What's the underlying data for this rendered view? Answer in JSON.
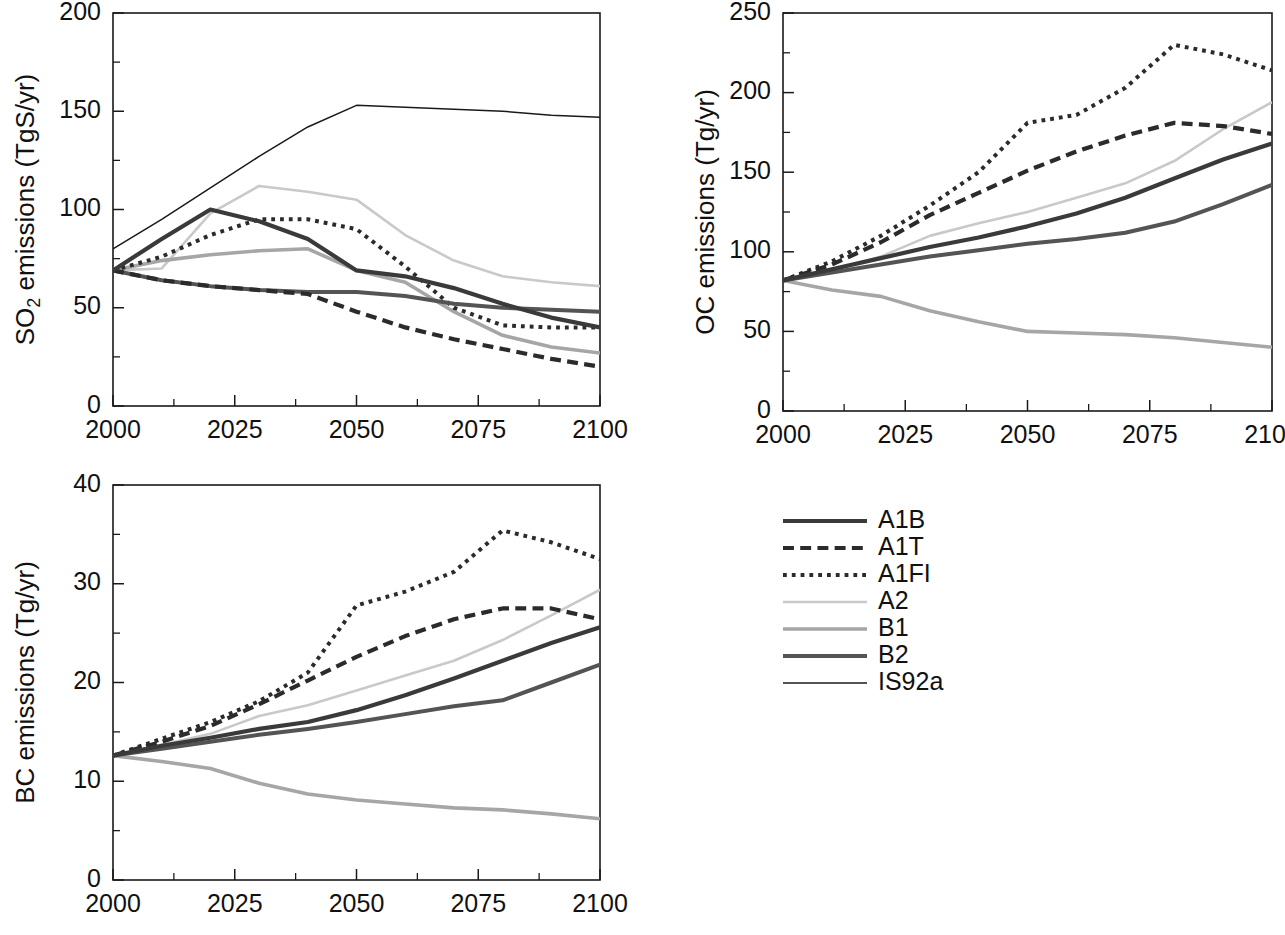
{
  "figure": {
    "panels": [
      "so2",
      "oc",
      "bc"
    ],
    "x_tick_labels": [
      "2000",
      "2025",
      "2050",
      "2075",
      "2100"
    ],
    "x_ticks": [
      2000,
      2025,
      2050,
      2075,
      2100
    ],
    "xlim": [
      2000,
      2100
    ],
    "x_minor_step": 12.5
  },
  "legend": {
    "position": "bottom-right",
    "entries": [
      {
        "label": "A1B",
        "style": "solid",
        "color": "#3a3a3a",
        "width": 4.2
      },
      {
        "label": "A1T",
        "style": "dashed",
        "color": "#2b2b2b",
        "width": 4.2
      },
      {
        "label": "A1FI",
        "style": "dotted",
        "color": "#2b2b2b",
        "width": 4.0
      },
      {
        "label": "A2",
        "style": "solid",
        "color": "#c9c9c9",
        "width": 2.6
      },
      {
        "label": "B1",
        "style": "solid",
        "color": "#a6a6a6",
        "width": 3.6
      },
      {
        "label": "B2",
        "style": "solid",
        "color": "#545454",
        "width": 4.0
      },
      {
        "label": "IS92a",
        "style": "solid",
        "color": "#1a1a1a",
        "width": 1.5
      }
    ]
  },
  "chart_data": [
    {
      "id": "so2",
      "type": "line",
      "title": "",
      "xlabel": "",
      "ylabel": "SO2 emissions  (TgS/yr)",
      "ylabel_base": "SO",
      "ylabel_sub": "2",
      "ylabel_rest": " emissions  (TgS/yr)",
      "xlim": [
        2000,
        2100
      ],
      "ylim": [
        0,
        200
      ],
      "y_ticks": [
        0,
        50,
        100,
        150,
        200
      ],
      "y_tick_labels": [
        "0",
        "50",
        "100",
        "150",
        "200"
      ],
      "y_minor_step": 25,
      "grid": false,
      "series": [
        {
          "name": "A1B",
          "x": [
            2000,
            2010,
            2020,
            2030,
            2040,
            2050,
            2060,
            2070,
            2080,
            2090,
            2100
          ],
          "values": [
            69,
            85,
            100,
            94,
            85,
            69,
            66,
            60,
            52,
            45,
            40
          ]
        },
        {
          "name": "A1T",
          "x": [
            2000,
            2010,
            2020,
            2030,
            2040,
            2050,
            2060,
            2070,
            2080,
            2090,
            2100
          ],
          "values": [
            69,
            64,
            61,
            59,
            57,
            48,
            40,
            34,
            29,
            24,
            20
          ]
        },
        {
          "name": "A1FI",
          "x": [
            2000,
            2010,
            2020,
            2030,
            2040,
            2050,
            2060,
            2070,
            2080,
            2090,
            2100
          ],
          "values": [
            69,
            76,
            87,
            95,
            95,
            90,
            71,
            50,
            41,
            40,
            40
          ]
        },
        {
          "name": "A2",
          "x": [
            2000,
            2010,
            2020,
            2030,
            2040,
            2050,
            2060,
            2070,
            2080,
            2090,
            2100
          ],
          "values": [
            69,
            70,
            98,
            112,
            109,
            105,
            87,
            74,
            66,
            63,
            61
          ]
        },
        {
          "name": "B1",
          "x": [
            2000,
            2010,
            2020,
            2030,
            2040,
            2050,
            2060,
            2070,
            2080,
            2090,
            2100
          ],
          "values": [
            69,
            74,
            77,
            79,
            80,
            69,
            63,
            48,
            36,
            30,
            27
          ]
        },
        {
          "name": "B2",
          "x": [
            2000,
            2010,
            2020,
            2030,
            2040,
            2050,
            2060,
            2070,
            2080,
            2090,
            2100
          ],
          "values": [
            69,
            64,
            61,
            59,
            58,
            58,
            56,
            52,
            50,
            49,
            48
          ]
        },
        {
          "name": "IS92a",
          "x": [
            2000,
            2010,
            2020,
            2030,
            2040,
            2050,
            2060,
            2070,
            2080,
            2090,
            2100
          ],
          "values": [
            80,
            95,
            111,
            127,
            142,
            153,
            152,
            151,
            150,
            148,
            147
          ]
        }
      ]
    },
    {
      "id": "oc",
      "type": "line",
      "title": "",
      "xlabel": "",
      "ylabel": "OC emissions  (Tg/yr)",
      "xlim": [
        2000,
        2100
      ],
      "ylim": [
        0,
        250
      ],
      "y_ticks": [
        0,
        50,
        100,
        150,
        200,
        250
      ],
      "y_tick_labels": [
        "0",
        "50",
        "100",
        "150",
        "200",
        "250"
      ],
      "y_minor_step": 25,
      "grid": false,
      "series": [
        {
          "name": "A1B",
          "x": [
            2000,
            2010,
            2020,
            2030,
            2040,
            2050,
            2060,
            2070,
            2080,
            2090,
            2100
          ],
          "values": [
            82,
            89,
            96,
            103,
            109,
            116,
            124,
            134,
            146,
            158,
            168
          ]
        },
        {
          "name": "A1T",
          "x": [
            2000,
            2010,
            2020,
            2030,
            2040,
            2050,
            2060,
            2070,
            2080,
            2090,
            2100
          ],
          "values": [
            82,
            92,
            106,
            123,
            137,
            151,
            163,
            173,
            181,
            179,
            174
          ]
        },
        {
          "name": "A1FI",
          "x": [
            2000,
            2010,
            2020,
            2030,
            2040,
            2050,
            2060,
            2070,
            2080,
            2090,
            2100
          ],
          "values": [
            82,
            94,
            110,
            129,
            150,
            181,
            186,
            203,
            230,
            224,
            214
          ]
        },
        {
          "name": "A2",
          "x": [
            2000,
            2010,
            2020,
            2030,
            2040,
            2050,
            2060,
            2070,
            2080,
            2090,
            2100
          ],
          "values": [
            82,
            88,
            97,
            110,
            118,
            125,
            134,
            143,
            157,
            177,
            194
          ]
        },
        {
          "name": "B1",
          "x": [
            2000,
            2010,
            2020,
            2030,
            2040,
            2050,
            2060,
            2070,
            2080,
            2090,
            2100
          ],
          "values": [
            82,
            76,
            72,
            63,
            56,
            50,
            49,
            48,
            46,
            43,
            40
          ]
        },
        {
          "name": "B2",
          "x": [
            2000,
            2010,
            2020,
            2030,
            2040,
            2050,
            2060,
            2070,
            2080,
            2090,
            2100
          ],
          "values": [
            82,
            87,
            92,
            97,
            101,
            105,
            108,
            112,
            119,
            130,
            142
          ]
        }
      ]
    },
    {
      "id": "bc",
      "type": "line",
      "title": "",
      "xlabel": "",
      "ylabel": "BC emissions  (Tg/yr)",
      "xlim": [
        2000,
        2100
      ],
      "ylim": [
        0,
        40
      ],
      "y_ticks": [
        0,
        10,
        20,
        30,
        40
      ],
      "y_tick_labels": [
        "0",
        "10",
        "20",
        "30",
        "40"
      ],
      "y_minor_step": 5,
      "grid": false,
      "series": [
        {
          "name": "A1B",
          "x": [
            2000,
            2010,
            2020,
            2030,
            2040,
            2050,
            2060,
            2070,
            2080,
            2090,
            2100
          ],
          "values": [
            12.6,
            13.6,
            14.4,
            15.3,
            16.0,
            17.2,
            18.7,
            20.4,
            22.2,
            24.0,
            25.6
          ]
        },
        {
          "name": "A1T",
          "x": [
            2000,
            2010,
            2020,
            2030,
            2040,
            2050,
            2060,
            2070,
            2080,
            2090,
            2100
          ],
          "values": [
            12.6,
            14.0,
            15.6,
            17.8,
            20.2,
            22.6,
            24.7,
            26.4,
            27.5,
            27.5,
            26.4
          ]
        },
        {
          "name": "A1FI",
          "x": [
            2000,
            2010,
            2020,
            2030,
            2040,
            2050,
            2060,
            2070,
            2080,
            2090,
            2100
          ],
          "values": [
            12.6,
            14.3,
            16.0,
            18.1,
            21.0,
            27.8,
            29.2,
            31.2,
            35.4,
            34.2,
            32.5
          ]
        },
        {
          "name": "A2",
          "x": [
            2000,
            2010,
            2020,
            2030,
            2040,
            2050,
            2060,
            2070,
            2080,
            2090,
            2100
          ],
          "values": [
            12.6,
            13.7,
            14.8,
            16.6,
            17.7,
            19.2,
            20.7,
            22.2,
            24.3,
            26.8,
            29.4
          ]
        },
        {
          "name": "B1",
          "x": [
            2000,
            2010,
            2020,
            2030,
            2040,
            2050,
            2060,
            2070,
            2080,
            2090,
            2100
          ],
          "values": [
            12.6,
            12.0,
            11.3,
            9.8,
            8.7,
            8.1,
            7.7,
            7.3,
            7.1,
            6.7,
            6.2
          ]
        },
        {
          "name": "B2",
          "x": [
            2000,
            2010,
            2020,
            2030,
            2040,
            2050,
            2060,
            2070,
            2080,
            2090,
            2100
          ],
          "values": [
            12.6,
            13.3,
            14.0,
            14.7,
            15.3,
            16.0,
            16.8,
            17.6,
            18.2,
            20.0,
            21.8
          ]
        }
      ]
    }
  ]
}
